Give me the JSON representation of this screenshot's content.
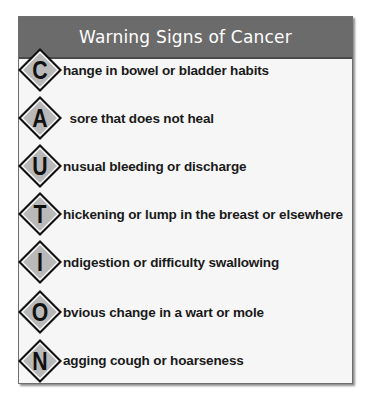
{
  "card": {
    "title": "Warning Signs of Cancer",
    "colors": {
      "header_bg": "#6b6b6b",
      "header_text": "#ffffff",
      "body_bg": "#f6f6f6",
      "diamond_fill": "#b9b9b9",
      "diamond_border": "#111111",
      "text": "#1a1a1a"
    },
    "items": [
      {
        "letter": "C",
        "text": "hange in bowel or bladder habits"
      },
      {
        "letter": "A",
        "text": " sore that does not heal"
      },
      {
        "letter": "U",
        "text": "nusual bleeding or discharge"
      },
      {
        "letter": "T",
        "text": "hickening or lump in the breast or elsewhere"
      },
      {
        "letter": "I",
        "text": "ndigestion or difficulty swallowing"
      },
      {
        "letter": "O",
        "text": "bvious change in a wart or mole"
      },
      {
        "letter": "N",
        "text": "agging cough or hoarseness"
      }
    ]
  }
}
